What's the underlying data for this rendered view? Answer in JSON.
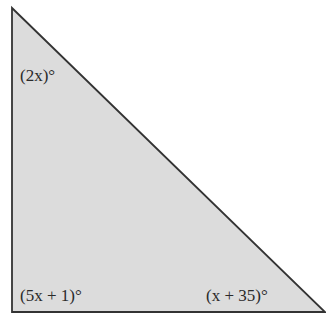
{
  "diagram": {
    "type": "right-triangle",
    "fill_color": "#dcdcdc",
    "stroke_color": "#333333",
    "angles": {
      "top": "(2x)°",
      "bottom_left": "(5x + 1)°",
      "bottom_right": "(x + 35)°"
    }
  }
}
